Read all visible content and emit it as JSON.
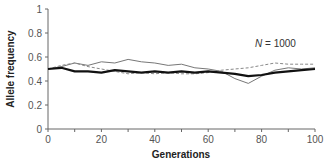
{
  "chart_data": {
    "type": "line",
    "title": "",
    "xlabel": "Generations",
    "ylabel": "Allele frequency",
    "xlim": [
      0,
      100
    ],
    "ylim": [
      0,
      1
    ],
    "x_ticks": [
      0,
      20,
      40,
      60,
      80,
      100
    ],
    "x_tick_labels": [
      "0",
      "20",
      "40",
      "60",
      "80",
      "100"
    ],
    "y_ticks": [
      0,
      0.2,
      0.4,
      0.6,
      0.8,
      1
    ],
    "y_tick_labels": [
      "0",
      "0.2",
      "0.4",
      "0.6",
      "0.8",
      "1"
    ],
    "grid": false,
    "legend": null,
    "annotation": {
      "italic": "N",
      "text": " = 1000",
      "x": 82,
      "y": 0.6
    },
    "x": [
      0,
      5,
      10,
      15,
      20,
      25,
      30,
      35,
      40,
      45,
      50,
      55,
      60,
      65,
      70,
      75,
      80,
      85,
      90,
      95,
      100
    ],
    "series": [
      {
        "name": "Population 1 (thick black)",
        "style": "solid-thick",
        "color": "#111111",
        "values": [
          0.5,
          0.51,
          0.48,
          0.48,
          0.47,
          0.49,
          0.48,
          0.47,
          0.48,
          0.47,
          0.48,
          0.47,
          0.48,
          0.47,
          0.46,
          0.44,
          0.45,
          0.47,
          0.48,
          0.49,
          0.5
        ]
      },
      {
        "name": "Population 2 (thin gray)",
        "style": "solid-thin",
        "color": "#777777",
        "values": [
          0.5,
          0.52,
          0.55,
          0.53,
          0.56,
          0.55,
          0.58,
          0.56,
          0.55,
          0.53,
          0.54,
          0.51,
          0.5,
          0.48,
          0.42,
          0.38,
          0.44,
          0.49,
          0.51,
          0.5,
          0.51
        ]
      },
      {
        "name": "Population 3 (dashed gray)",
        "style": "dashed",
        "color": "#888888",
        "values": [
          0.5,
          0.53,
          0.55,
          0.52,
          0.5,
          0.48,
          0.46,
          0.47,
          0.46,
          0.47,
          0.46,
          0.46,
          0.47,
          0.49,
          0.5,
          0.51,
          0.53,
          0.55,
          0.54,
          0.54,
          0.54
        ]
      }
    ]
  }
}
